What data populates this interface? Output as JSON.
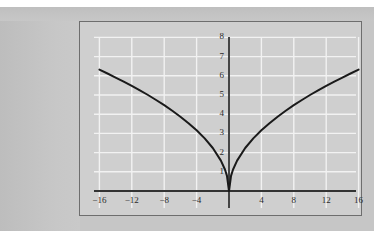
{
  "figure": {
    "background_color": "#c6c6c6",
    "plot_background_color": "#cfcfcf",
    "grid_color": "#f2f2f2",
    "axis_color": "#333333",
    "curve_color": "#1a1a1a",
    "frame_border_color": "#6e6e6e"
  },
  "chart_data": {
    "type": "line",
    "title": "",
    "xlabel": "",
    "ylabel": "",
    "xlim": [
      -16.8,
      16.8
    ],
    "ylim": [
      -1.1,
      8.3
    ],
    "grid": true,
    "legend": null,
    "xticks": [
      -16,
      -12,
      -8,
      -4,
      4,
      8,
      12,
      16
    ],
    "xtick_labels": [
      "−16",
      "−12",
      "−8",
      "−4",
      "4",
      "8",
      "12",
      "16"
    ],
    "yticks": [
      1,
      2,
      3,
      4,
      5,
      6,
      7,
      8
    ],
    "ytick_labels": [
      "1",
      "2",
      "3",
      "4",
      "5",
      "6",
      "7",
      "8"
    ],
    "x_gridlines": [
      -16,
      -12,
      -8,
      -4,
      0,
      4,
      8,
      12,
      16
    ],
    "y_gridlines": [
      1,
      2,
      3,
      4,
      5,
      6,
      7,
      8
    ],
    "series": [
      {
        "name": "y = 1.58√|x|",
        "x": [
          -16,
          -15,
          -14,
          -13,
          -12,
          -11,
          -10,
          -9,
          -8,
          -7,
          -6,
          -5,
          -4,
          -3,
          -2,
          -1,
          -0.5,
          -0.25,
          0,
          0.25,
          0.5,
          1,
          2,
          3,
          4,
          5,
          6,
          7,
          8,
          9,
          10,
          11,
          12,
          13,
          14,
          15,
          16
        ],
        "y": [
          6.32,
          6.12,
          5.91,
          5.7,
          5.47,
          5.24,
          5.0,
          4.74,
          4.47,
          4.18,
          3.87,
          3.53,
          3.16,
          2.74,
          2.24,
          1.58,
          1.12,
          0.79,
          0,
          0.79,
          1.12,
          1.58,
          2.24,
          2.74,
          3.16,
          3.53,
          3.87,
          4.18,
          4.47,
          4.74,
          5.0,
          5.24,
          5.47,
          5.7,
          5.91,
          6.12,
          6.32
        ]
      }
    ],
    "annotations": []
  }
}
